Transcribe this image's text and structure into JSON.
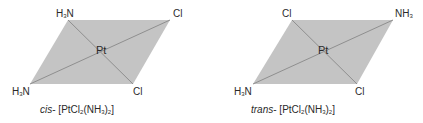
{
  "colors": {
    "plane_fill": "#c4c4c4",
    "bond_line": "#8f8f8f",
    "text": "#2a2a2a",
    "background": "#ffffff"
  },
  "cis": {
    "center": "Pt",
    "top_left": {
      "main": "H",
      "sub": "3",
      "tail": "N"
    },
    "top_right": "Cl",
    "bottom_left": {
      "main": "H",
      "sub": "3",
      "tail": "N"
    },
    "bottom_right": "Cl",
    "caption": {
      "prefix": "cis",
      "dash": "-",
      "formula_a": "[PtCl",
      "sub1": "2",
      "formula_b": "(NH",
      "sub2": "3",
      "formula_c": ")",
      "sub3": "2",
      "formula_d": "]"
    }
  },
  "trans": {
    "center": "Pt",
    "top_left": "Cl",
    "top_right": {
      "main": "NH",
      "sub": "3"
    },
    "bottom_left": {
      "main": "H",
      "sub": "3",
      "tail": "N"
    },
    "bottom_right": "Cl",
    "caption": {
      "prefix": "trans",
      "dash": "-",
      "formula_a": "[PtCl",
      "sub1": "2",
      "formula_b": "(NH",
      "sub2": "3",
      "formula_c": ")",
      "sub3": "2",
      "formula_d": "]"
    }
  }
}
